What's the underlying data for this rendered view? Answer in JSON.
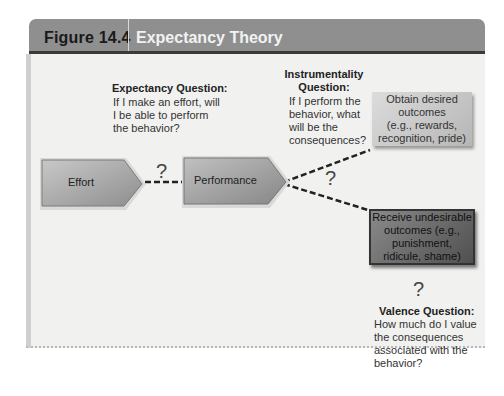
{
  "figure": {
    "number": "Figure 14.4",
    "title": "Expectancy Theory"
  },
  "questions": {
    "expectancy": {
      "heading": "Expectancy Question:",
      "lines": [
        "If I make an effort, will",
        "I be able to perform",
        "the behavior?"
      ]
    },
    "instrumentality": {
      "heading_lines": [
        "Instrumentality",
        "Question:"
      ],
      "lines": [
        "If I perform the",
        "behavior, what",
        "will be the",
        "consequences?"
      ]
    },
    "valence": {
      "heading": "Valence Question:",
      "lines": [
        "How much do I value",
        "the consequences",
        "associated with the",
        "behavior?"
      ]
    }
  },
  "nodes": {
    "effort": "Effort",
    "performance": "Performance",
    "desired": [
      "Obtain desired",
      "outcomes",
      "(e.g., rewards,",
      "recognition, pride)"
    ],
    "undesirable": [
      "Receive undesirable",
      "outcomes (e.g.,",
      "punishment,",
      "ridicule, shame)"
    ]
  },
  "connectors": {
    "question_mark": "?"
  },
  "colors": {
    "header_bg": "#8f8f8f",
    "header_title": "#f2f2f2",
    "panel_bg": "#f1f1f0",
    "arrow_fill": "#a8a8a8",
    "dark_box": "#5a5a5a"
  }
}
